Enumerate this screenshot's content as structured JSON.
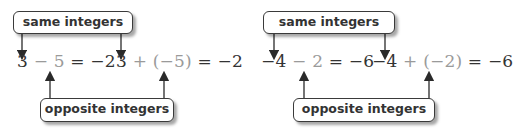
{
  "labels": {
    "same": "same integers",
    "opposite": "opposite integers"
  },
  "colors": {
    "text": "#333333",
    "highlight": "#9a9a9a",
    "border": "#3a3a3a"
  },
  "panels": [
    {
      "subtraction": {
        "first": "3",
        "op": " − ",
        "second": "5",
        "rest": " = −2"
      },
      "addition": {
        "first": "3",
        "op": " + ",
        "second": "(−5)",
        "rest": " = −2"
      }
    },
    {
      "subtraction": {
        "first": "−4",
        "op": " − ",
        "second": "2",
        "rest": " = −6"
      },
      "addition": {
        "first": "−4",
        "op": " + ",
        "second": "(−2)",
        "rest": " = −6"
      }
    }
  ]
}
